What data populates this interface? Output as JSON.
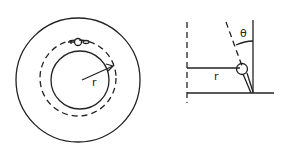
{
  "diagram": {
    "type": "physics-sketch",
    "left_view": {
      "description": "top view: outer circle, dashed orbit circle, inner circle, object on orbit, radius arrow",
      "radius_label": "r"
    },
    "right_view": {
      "description": "side view: dashed vertical axis, horizontal radius line, ball on tilted rod, dashed tilt line with angle",
      "radius_label": "r",
      "angle_label": "θ"
    },
    "stroke_color": "#222222",
    "background": "#ffffff"
  }
}
